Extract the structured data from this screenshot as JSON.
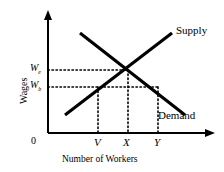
{
  "figure": {
    "type": "economics-supply-demand",
    "background": "#ffffff",
    "ink": "#000000"
  },
  "axes": {
    "y_title": "Wages",
    "x_title": "Number of Workers",
    "origin_label": "0",
    "x_axis_y": 133,
    "y_axis_x": 48,
    "x_arrow_end": 213,
    "y_arrow_end": 12
  },
  "y_ticks": [
    {
      "label": "W",
      "sub": "e",
      "y": 70
    },
    {
      "label": "W",
      "sub": "b",
      "y": 87
    }
  ],
  "x_ticks": [
    {
      "label": "V",
      "x": 98
    },
    {
      "label": "X",
      "x": 128
    },
    {
      "label": "Y",
      "x": 158
    }
  ],
  "curves": [
    {
      "name": "Supply",
      "label": "Supply",
      "slope": "upward",
      "x1": 65,
      "y1": 115,
      "x2": 172,
      "y2": 33,
      "label_x": 176,
      "label_y": 28
    },
    {
      "name": "Demand",
      "label": "Demand",
      "slope": "downward",
      "x1": 80,
      "y1": 33,
      "x2": 185,
      "y2": 115,
      "label_x": 160,
      "label_y": 114
    }
  ],
  "equilibrium": {
    "x": 128,
    "y": 70,
    "wage": "W_e",
    "quantity": "X"
  },
  "guides": {
    "horizontal": [
      {
        "from_wage": "W_e",
        "y": 70,
        "x_start": 48,
        "x_end": 128
      },
      {
        "from_wage": "W_b",
        "y": 87,
        "x_start": 48,
        "x_end": 158
      }
    ],
    "vertical": [
      {
        "at_tick": "V",
        "x": 98,
        "y_start": 87,
        "y_end": 133
      },
      {
        "at_tick": "X",
        "x": 128,
        "y_start": 70,
        "y_end": 133
      },
      {
        "at_tick": "Y",
        "x": 158,
        "y_start": 87,
        "y_end": 133
      }
    ]
  }
}
